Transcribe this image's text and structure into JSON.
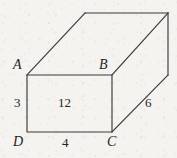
{
  "figure": {
    "name": "rectangular-prism-diagram",
    "background_color": "#f4f3f0",
    "line_color": "#3a3a3a",
    "text_color": "#242424",
    "vertices": {
      "A": "A",
      "B": "B",
      "C": "C",
      "D": "D"
    },
    "dimensions": {
      "left_height": "3",
      "face_area": "12",
      "bottom_width": "4",
      "depth": "6"
    },
    "geometry": {
      "front_face": {
        "A": [
          27,
          75
        ],
        "B": [
          112,
          75
        ],
        "C": [
          112,
          132
        ],
        "D": [
          27,
          132
        ]
      },
      "back_top_left": [
        85,
        13
      ],
      "back_top_right": [
        168,
        13
      ],
      "back_bottom_right": [
        168,
        75
      ]
    }
  }
}
